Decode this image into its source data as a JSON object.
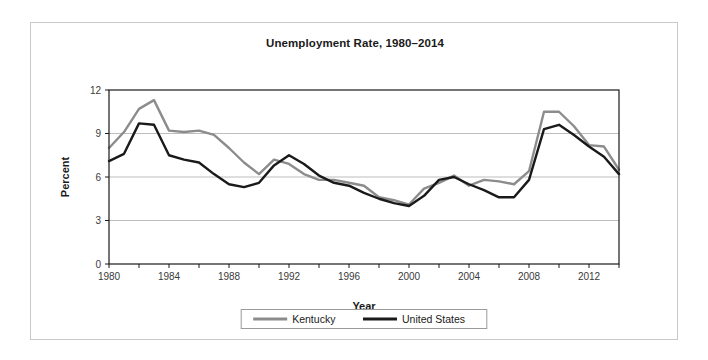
{
  "chart_data": {
    "type": "line",
    "title": "Unemployment Rate, 1980–2014",
    "xlabel": "Year",
    "ylabel": "Percent",
    "xlim": [
      1980,
      2014
    ],
    "ylim": [
      0,
      12
    ],
    "yticks": [
      0,
      3,
      6,
      9,
      12
    ],
    "ytick_labels": [
      "0",
      "3",
      "6",
      "9",
      "12"
    ],
    "xticks": [
      1980,
      1982,
      1984,
      1986,
      1988,
      1990,
      1992,
      1994,
      1996,
      1998,
      2000,
      2002,
      2004,
      2006,
      2008,
      2010,
      2012,
      2014
    ],
    "xtick_labels": [
      "1980",
      "",
      "1984",
      "",
      "1988",
      "",
      "1992",
      "",
      "1996",
      "",
      "2000",
      "",
      "2004",
      "",
      "2008",
      "",
      "2012",
      ""
    ],
    "grid": "horizontal",
    "legend_position": "bottom",
    "x": [
      1980,
      1981,
      1982,
      1983,
      1984,
      1985,
      1986,
      1987,
      1988,
      1989,
      1990,
      1991,
      1992,
      1993,
      1994,
      1995,
      1996,
      1997,
      1998,
      1999,
      2000,
      2001,
      2002,
      2003,
      2004,
      2005,
      2006,
      2007,
      2008,
      2009,
      2010,
      2011,
      2012,
      2013,
      2014
    ],
    "series": [
      {
        "name": "Kentucky",
        "color": "#8c8c8c",
        "values": [
          8.0,
          9.1,
          10.7,
          11.3,
          9.2,
          9.1,
          9.2,
          8.9,
          8.0,
          7.0,
          6.2,
          7.2,
          6.9,
          6.2,
          5.8,
          5.8,
          5.6,
          5.4,
          4.6,
          4.4,
          4.1,
          5.2,
          5.6,
          6.1,
          5.4,
          5.8,
          5.7,
          5.5,
          6.4,
          10.5,
          10.5,
          9.5,
          8.2,
          8.1,
          6.5
        ]
      },
      {
        "name": "United States",
        "color": "#1a1a1a",
        "values": [
          7.1,
          7.6,
          9.7,
          9.6,
          7.5,
          7.2,
          7.0,
          6.2,
          5.5,
          5.3,
          5.6,
          6.8,
          7.5,
          6.9,
          6.1,
          5.6,
          5.4,
          4.9,
          4.5,
          4.2,
          4.0,
          4.7,
          5.8,
          6.0,
          5.5,
          5.1,
          4.6,
          4.6,
          5.8,
          9.3,
          9.6,
          8.9,
          8.1,
          7.4,
          6.2
        ]
      }
    ]
  }
}
